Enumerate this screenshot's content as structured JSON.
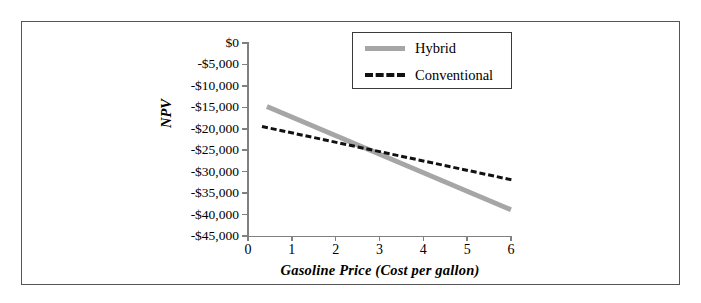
{
  "figure": {
    "background": "#ffffff",
    "border_color": "#555555"
  },
  "chart_data": {
    "type": "line",
    "title": "",
    "xlabel": "Gasoline Price (Cost per gallon)",
    "ylabel": "NPV",
    "xlim": [
      0,
      6
    ],
    "ylim": [
      -45000,
      0
    ],
    "grid": false,
    "legend_position": "top-center",
    "xticks": [
      0,
      1,
      2,
      3,
      4,
      5,
      6
    ],
    "xticklabels": [
      "0",
      "1",
      "2",
      "3",
      "4",
      "5",
      "6"
    ],
    "yticks": [
      0,
      -5000,
      -10000,
      -15000,
      -20000,
      -25000,
      -30000,
      -35000,
      -40000,
      -45000
    ],
    "yticklabels": [
      "$0",
      "-$5,000",
      "-$10,000",
      "-$15,000",
      "-$20,000",
      "-$25,000",
      "-$30,000",
      "-$35,000",
      "-$40,000",
      "-$45,000"
    ],
    "series": [
      {
        "name": "Hybrid",
        "style": "solid",
        "color": "#a6a6a6",
        "width": 4.5,
        "x": [
          0.43,
          6.0
        ],
        "values": [
          -14200,
          -38300
        ]
      },
      {
        "name": "Conventional",
        "style": "dashed",
        "color": "#111111",
        "width": 3.5,
        "x": [
          0.32,
          6.0
        ],
        "values": [
          -19100,
          -31500
        ]
      }
    ],
    "intersection": {
      "x": 2.8,
      "y": -24500
    }
  },
  "legend": {
    "entries": [
      {
        "label": "Hybrid",
        "swatch": "solid-line-swatch",
        "color": "#a6a6a6"
      },
      {
        "label": "Conventional",
        "swatch": "dashed-line-swatch",
        "color": "#111111"
      }
    ]
  }
}
